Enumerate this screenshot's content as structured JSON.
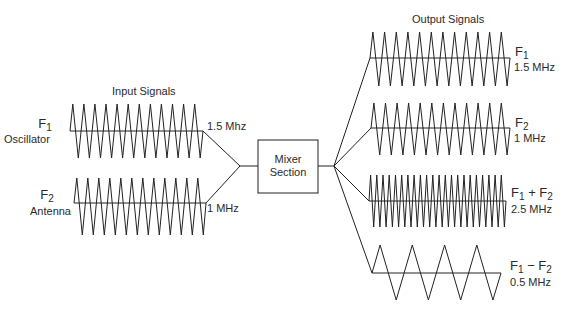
{
  "input_section": {
    "title": "Input Signals",
    "signals": [
      {
        "symbol": "F",
        "subscript": "1",
        "name": "Oscillator",
        "frequency": "1.5 Mhz",
        "cycles": 12
      },
      {
        "symbol": "F",
        "subscript": "2",
        "name": "Antenna",
        "frequency": "1 MHz",
        "cycles": 12
      }
    ]
  },
  "mixer": {
    "line1": "Mixer",
    "line2": "Section"
  },
  "output_section": {
    "title": "Output Signals",
    "signals": [
      {
        "label": "F1",
        "frequency": "1.5 MHz",
        "cycles": 12
      },
      {
        "label": "F2",
        "frequency": "1 MHz",
        "cycles": 12
      },
      {
        "label": "F1 + F2",
        "frequency": "2.5 MHz",
        "cycles": 22
      },
      {
        "label": "F1 − F2",
        "frequency": "0.5 MHz",
        "cycles": 4
      }
    ],
    "labels": {
      "o1_sym": "F",
      "o1_sub": "1",
      "o2_sym": "F",
      "o2_sub": "2",
      "o3_a": "F",
      "o3_a_sub": "1",
      "o3_op": " + ",
      "o3_b": "F",
      "o3_b_sub": "2",
      "o4_a": "F",
      "o4_a_sub": "1",
      "o4_op": " − ",
      "o4_b": "F",
      "o4_b_sub": "2"
    }
  },
  "colors": {
    "line": "#222222",
    "background": "#ffffff"
  }
}
